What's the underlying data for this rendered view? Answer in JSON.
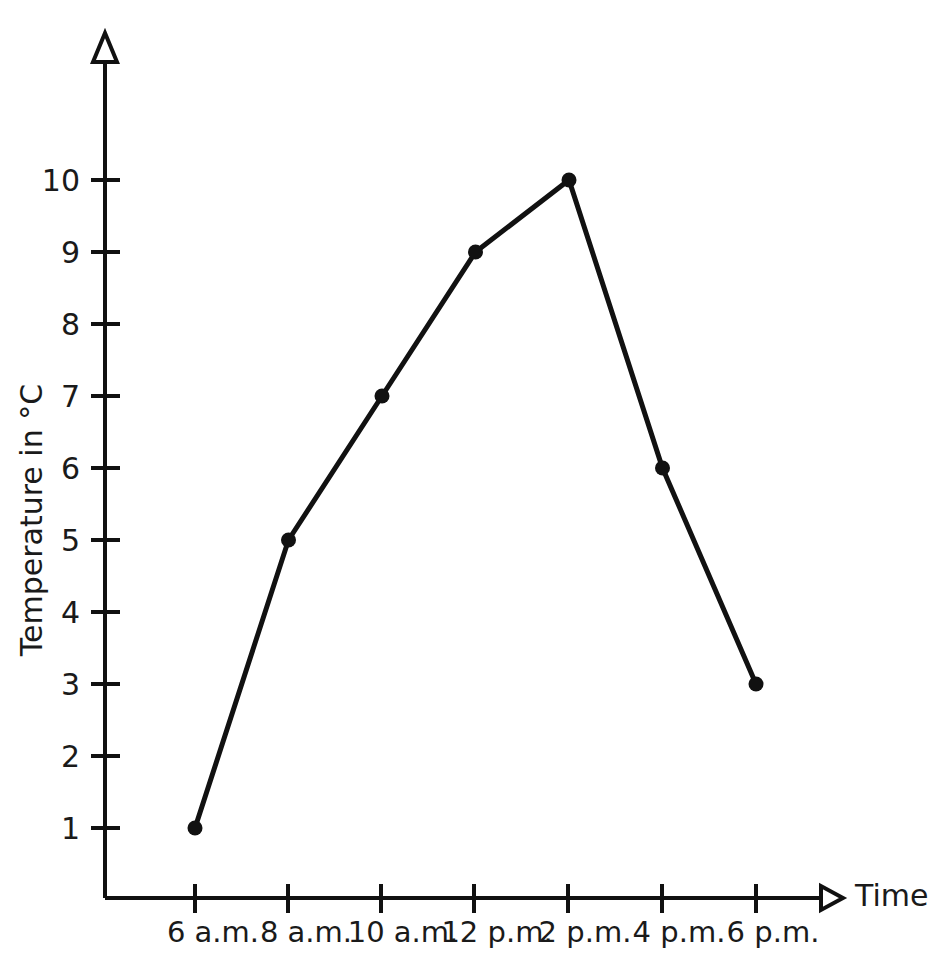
{
  "chart_data": {
    "type": "line",
    "title": "",
    "xlabel": "Time",
    "ylabel": "Temperature in °C",
    "categories": [
      "6 a.m.",
      "8 a.m.",
      "10 a.m.",
      "12 p.m.",
      "2 p.m.",
      "4 p.m.",
      "6 p.m."
    ],
    "values": [
      1,
      5,
      7,
      9,
      10,
      6,
      3
    ],
    "series": [
      {
        "name": "Temperature",
        "values": [
          1,
          5,
          7,
          9,
          10,
          6,
          3
        ]
      }
    ],
    "points": [
      {
        "x": "6 a.m.",
        "y": 1
      },
      {
        "x": "8 a.m.",
        "y": 5
      },
      {
        "x": "10 a.m.",
        "y": 7
      },
      {
        "x": "12 p.m.",
        "y": 9
      },
      {
        "x": "2 p.m.",
        "y": 10
      },
      {
        "x": "4 p.m.",
        "y": 6
      },
      {
        "x": "6 p.m.",
        "y": 3
      }
    ],
    "ytick_labels": [
      "1",
      "2",
      "3",
      "4",
      "5",
      "6",
      "7",
      "8",
      "9",
      "10"
    ],
    "ytick_values": [
      1,
      2,
      3,
      4,
      5,
      6,
      7,
      8,
      9,
      10
    ],
    "ylim": [
      0,
      11.5
    ],
    "xlim": [
      0,
      8
    ],
    "grid": false,
    "legend": null,
    "legend_position": "none",
    "marker": "filled-circle",
    "line_color": "#111111",
    "marker_color": "#111111",
    "axis_color": "#111111",
    "background_color": "#ffffff",
    "x_axis_arrow": true,
    "y_axis_arrow": true,
    "annotations": []
  },
  "labels": {
    "y_axis_title": "Temperature in °C",
    "x_axis_title": "Time",
    "y_ticks": [
      "1",
      "2",
      "3",
      "4",
      "5",
      "6",
      "7",
      "8",
      "9",
      "10"
    ],
    "x_ticks": [
      "6 a.m.",
      "8 a.m.",
      "10 a.m.",
      "12 p.m.",
      "2 p.m.",
      "4 p.m.",
      "6 p.m."
    ]
  }
}
